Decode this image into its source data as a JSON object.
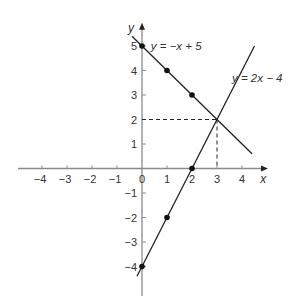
{
  "chart_data": {
    "type": "line",
    "title": "",
    "xlabel": "x",
    "ylabel": "y",
    "xlim": [
      -5,
      4.6
    ],
    "ylim": [
      -4.7,
      5.5
    ],
    "grid": false,
    "x_ticks": [
      -4,
      -3,
      -2,
      -1,
      0,
      1,
      2,
      3,
      4
    ],
    "y_ticks": [
      -4,
      -3,
      -2,
      -1,
      1,
      2,
      3,
      4,
      5
    ],
    "series": [
      {
        "name": "y = −x + 5",
        "label": "y = −x + 5",
        "slope": -1,
        "intercept": 5,
        "x_range": [
          -0.4,
          4.4
        ],
        "points": [
          {
            "x": 0,
            "y": 5
          },
          {
            "x": 1,
            "y": 4
          },
          {
            "x": 2,
            "y": 3
          }
        ]
      },
      {
        "name": "y = 2x − 4",
        "label": "y = 2x − 4",
        "slope": 2,
        "intercept": -4,
        "x_range": [
          -0.2,
          4.5
        ],
        "points": [
          {
            "x": 0,
            "y": -4
          },
          {
            "x": 1,
            "y": -2
          },
          {
            "x": 2,
            "y": 0
          }
        ]
      }
    ],
    "annotations": [
      {
        "type": "intersection",
        "x": 3,
        "y": 2,
        "style": "dashed guide lines to axes"
      }
    ]
  },
  "labels": {
    "x_axis": "x",
    "y_axis": "y",
    "origin": "0",
    "line1": "y = −x + 5",
    "line2": "y = 2x − 4"
  }
}
